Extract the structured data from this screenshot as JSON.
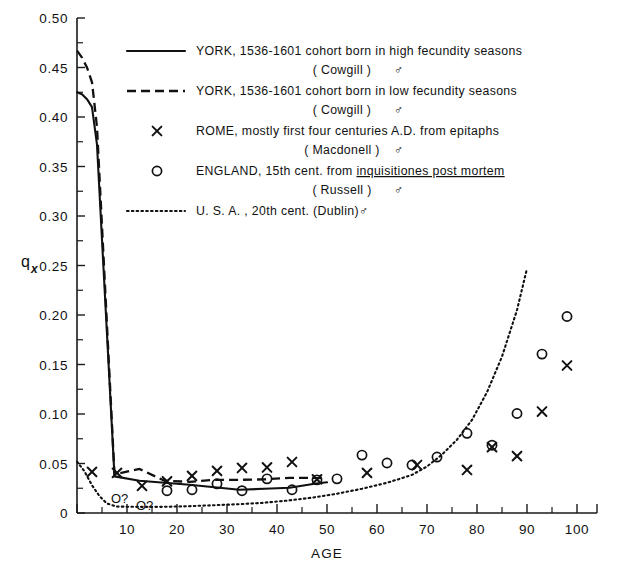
{
  "chart_data": {
    "type": "line",
    "title": "",
    "xlabel": "AGE",
    "ylabel": "q",
    "ylabel_sub": "x",
    "xlim": [
      0,
      104
    ],
    "ylim": [
      0,
      0.5
    ],
    "grid": false,
    "x_ticks": [
      0,
      10,
      20,
      30,
      40,
      50,
      60,
      70,
      80,
      90,
      100
    ],
    "x_tick_labels": [
      "",
      "10",
      "20",
      "30",
      "40",
      "50",
      "60",
      "70",
      "80",
      "90",
      "100"
    ],
    "x_minor_step": 5,
    "y_ticks": [
      0,
      0.05,
      0.1,
      0.15,
      0.2,
      0.25,
      0.3,
      0.35,
      0.4,
      0.45,
      0.5
    ],
    "y_tick_labels": [
      "0",
      "0.05",
      "0.10",
      "0.15",
      "0.20",
      "0.25",
      "0.30",
      "0.35",
      "0.40",
      "0.45",
      "0.50"
    ],
    "y_minor_step": 0.025,
    "legend_position": "upper-right-inside",
    "series": [
      {
        "name": "YORK, 1536-1601 cohort born in high fecundity seasons (Cowgill)",
        "style": "solid",
        "marker": "none",
        "x": [
          0,
          1,
          2,
          3,
          4,
          7.5,
          12.5,
          17.5,
          22.5,
          27.5,
          32.5,
          37.5,
          42.5,
          47.5,
          50
        ],
        "y": [
          0.425,
          0.423,
          0.418,
          0.41,
          0.372,
          0.037,
          0.0325,
          0.0305,
          0.0285,
          0.026,
          0.0235,
          0.0245,
          0.0255,
          0.0295,
          0.031
        ]
      },
      {
        "name": "YORK, 1536-1601 cohort born in low fecundity seasons (Cowgill)",
        "style": "dashed",
        "marker": "none",
        "x": [
          0,
          1,
          2,
          3,
          4,
          7.5,
          12.5,
          17.5,
          22.5,
          27.5,
          32.5,
          37.5,
          42.5,
          47.5,
          50
        ],
        "y": [
          0.467,
          0.46,
          0.45,
          0.435,
          0.39,
          0.039,
          0.0445,
          0.0325,
          0.0315,
          0.0335,
          0.0335,
          0.034,
          0.0355,
          0.0355,
          0.035
        ]
      },
      {
        "name": "U.S.A., 20th cent. (Dublin)",
        "style": "dotted",
        "marker": "none",
        "x": [
          0,
          1.5,
          3,
          4.5,
          6,
          8,
          12,
          17,
          22,
          27,
          32,
          37,
          42,
          47,
          52,
          57,
          62,
          67,
          70,
          73,
          76,
          79,
          82,
          85,
          88,
          90
        ],
        "y": [
          0.052,
          0.042,
          0.028,
          0.017,
          0.0095,
          0.0065,
          0.0062,
          0.0062,
          0.0068,
          0.0078,
          0.0088,
          0.0102,
          0.0125,
          0.0155,
          0.0195,
          0.0245,
          0.0305,
          0.0385,
          0.047,
          0.059,
          0.074,
          0.094,
          0.122,
          0.158,
          0.205,
          0.247
        ]
      }
    ],
    "scatter": [
      {
        "name": "ROME, mostly first four centuries A.D. from epitaphs (Macdonell)",
        "marker": "x",
        "points": [
          {
            "x": 3,
            "y": 0.0415
          },
          {
            "x": 8,
            "y": 0.0405
          },
          {
            "x": 13,
            "y": 0.0275
          },
          {
            "x": 18,
            "y": 0.032
          },
          {
            "x": 23,
            "y": 0.0375
          },
          {
            "x": 28,
            "y": 0.0425
          },
          {
            "x": 33,
            "y": 0.0455
          },
          {
            "x": 38,
            "y": 0.046
          },
          {
            "x": 43,
            "y": 0.0515
          },
          {
            "x": 48,
            "y": 0.034
          },
          {
            "x": 58,
            "y": 0.0405
          },
          {
            "x": 68,
            "y": 0.0485
          },
          {
            "x": 78,
            "y": 0.0435
          },
          {
            "x": 83,
            "y": 0.0665
          },
          {
            "x": 88,
            "y": 0.0575
          },
          {
            "x": 93,
            "y": 0.1025
          },
          {
            "x": 98,
            "y": 0.149
          }
        ]
      },
      {
        "name": "ENGLAND, 15th cent. from inquisitiones post mortem (Russell)",
        "marker": "o",
        "points": [
          {
            "x": 18,
            "y": 0.0225
          },
          {
            "x": 23,
            "y": 0.0235
          },
          {
            "x": 28,
            "y": 0.0295
          },
          {
            "x": 33,
            "y": 0.0225
          },
          {
            "x": 38,
            "y": 0.0345
          },
          {
            "x": 43,
            "y": 0.0235
          },
          {
            "x": 48,
            "y": 0.0335
          },
          {
            "x": 52,
            "y": 0.0345
          },
          {
            "x": 57,
            "y": 0.0585
          },
          {
            "x": 62,
            "y": 0.0505
          },
          {
            "x": 67,
            "y": 0.0485
          },
          {
            "x": 72,
            "y": 0.0565
          },
          {
            "x": 78,
            "y": 0.0805
          },
          {
            "x": 83,
            "y": 0.0685
          },
          {
            "x": 88,
            "y": 0.1005
          },
          {
            "x": 93,
            "y": 0.1605
          },
          {
            "x": 98,
            "y": 0.1985
          }
        ],
        "uncertain_points": [
          {
            "x": 8,
            "y": 0.0155,
            "label": "O?"
          },
          {
            "x": 13,
            "y": 0.0085,
            "label": "O?"
          }
        ]
      }
    ]
  },
  "legend": {
    "entries": [
      {
        "symbol": "line-solid",
        "line1": "YORK, 1536-1601 cohort born in high fecundity seasons",
        "line2": "( Cowgill )",
        "sex": "♂",
        "underline": false
      },
      {
        "symbol": "line-dashed",
        "line1": "YORK, 1536-1601 cohort born in low fecundity seasons",
        "line2": "( Cowgill )",
        "sex": "♂",
        "underline": false
      },
      {
        "symbol": "X",
        "line1": "ROME, mostly first four centuries A.D. from epitaphs",
        "line2": "( Macdonell )",
        "sex": "♂",
        "underline": false
      },
      {
        "symbol": "O",
        "line1_pre": "ENGLAND, 15th cent. from ",
        "line1_em": "inquisitiones post mortem",
        "line2": "( Russell )",
        "sex": "♂",
        "underline": true
      },
      {
        "symbol": "line-dotted",
        "line1": "U. S. A. , 20th cent. (Dublin)",
        "line2": "",
        "sex": "♂",
        "underline": false
      }
    ]
  }
}
